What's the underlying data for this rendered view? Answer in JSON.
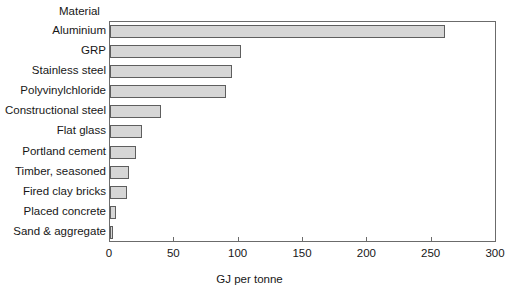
{
  "chart_data": {
    "type": "bar",
    "orientation": "horizontal",
    "title": "",
    "xlabel": "GJ per tonne",
    "ylabel": "Material",
    "xlim": [
      0,
      300
    ],
    "xticks": [
      0,
      50,
      100,
      150,
      200,
      250,
      300
    ],
    "grid": false,
    "legend": null,
    "categories": [
      "Aluminium",
      "GRP",
      "Stainless steel",
      "Polyvinylchloride",
      "Constructional steel",
      "Flat glass",
      "Portland cement",
      "Timber, seasoned",
      "Fired clay bricks",
      "Placed concrete",
      "Sand & aggregate"
    ],
    "values": [
      260,
      102,
      95,
      90,
      40,
      25,
      20,
      15,
      13,
      5,
      2
    ],
    "bar_fill_color": "#d6d6d6",
    "bar_edge_color": "#5e5e5e",
    "axis_color": "#6b6b6b",
    "text_color": "#171717"
  }
}
